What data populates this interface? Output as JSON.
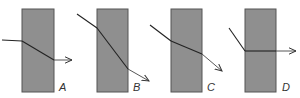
{
  "figure": {
    "panels": [
      {
        "label": "A",
        "block": {
          "x": 22,
          "y": 9,
          "w": 32,
          "h": 83
        },
        "ray_in": "2,40 22,41",
        "ray_inside": "22,41 54,60",
        "ray_out": {
          "x1": 54,
          "y1": 60,
          "x2": 72,
          "y2": 60
        },
        "label_pos": {
          "x": 59,
          "y": 91
        }
      },
      {
        "label": "B",
        "block": {
          "x": 97,
          "y": 9,
          "w": 31,
          "h": 83
        },
        "ray_in": "77,14 97,28",
        "ray_inside": "97,28 128,69",
        "ray_out": {
          "x1": 128,
          "y1": 69,
          "x2": 149,
          "y2": 81
        },
        "label_pos": {
          "x": 133,
          "y": 91
        }
      },
      {
        "label": "C",
        "block": {
          "x": 171,
          "y": 9,
          "w": 31,
          "h": 83
        },
        "ray_in": "150,25 171,41",
        "ray_inside": "171,41 202,54",
        "ray_out": {
          "x1": 202,
          "y1": 54,
          "x2": 222,
          "y2": 71
        },
        "label_pos": {
          "x": 207,
          "y": 91
        }
      },
      {
        "label": "D",
        "block": {
          "x": 245,
          "y": 9,
          "w": 31,
          "h": 83
        },
        "ray_in": "229,28 245,51",
        "ray_inside": "245,51 276,51",
        "ray_out": {
          "x1": 276,
          "y1": 51,
          "x2": 296,
          "y2": 51
        },
        "label_pos": {
          "x": 282,
          "y": 91
        }
      }
    ]
  }
}
